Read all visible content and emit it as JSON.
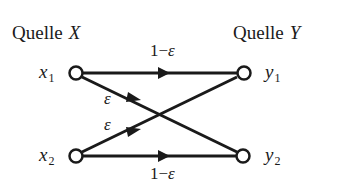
{
  "diagram": {
    "type": "binary-symmetric-channel",
    "source_x": {
      "label": "Quelle",
      "var": "X"
    },
    "source_y": {
      "label": "Quelle",
      "var": "Y"
    },
    "nodes": {
      "x1": {
        "base": "x",
        "sub": "1"
      },
      "x2": {
        "base": "x",
        "sub": "2"
      },
      "y1": {
        "base": "y",
        "sub": "1"
      },
      "y2": {
        "base": "y",
        "sub": "2"
      }
    },
    "edges": {
      "x1_y1": {
        "prefix": "1−",
        "symbol": "ε"
      },
      "x2_y2": {
        "prefix": "1−",
        "symbol": "ε"
      },
      "x1_y2": {
        "symbol": "ε"
      },
      "x2_y1": {
        "symbol": "ε"
      }
    },
    "colors": {
      "stroke": "#1a1a1a",
      "background": "#ffffff"
    }
  }
}
